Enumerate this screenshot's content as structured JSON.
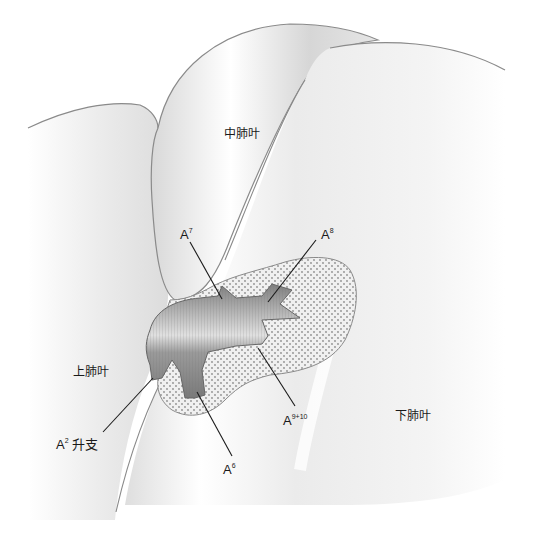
{
  "figure": {
    "type": "anatomical-illustration",
    "colors": {
      "background": "#ffffff",
      "lobe_fill": "#f2f2f2",
      "lobe_outline": "#8a8a8a",
      "artery_fill": "#8c8c8c",
      "artery_highlight": "#e8e8e8",
      "tissue_fill": "#ededed",
      "tissue_dots": "#9a9a9a",
      "leader_line": "#1a1a1a"
    }
  },
  "labels": {
    "middle_lobe": "中肺叶",
    "upper_lobe": "上肺叶",
    "lower_lobe": "下肺叶",
    "a7": {
      "base": "A",
      "sup": "7"
    },
    "a8": {
      "base": "A",
      "sup": "8"
    },
    "a9_10": {
      "base": "A",
      "sup": "9+10"
    },
    "a6": {
      "base": "A",
      "sup": "6"
    },
    "a2": {
      "base": "A",
      "sup": "2",
      "suffix": " 升支"
    }
  }
}
